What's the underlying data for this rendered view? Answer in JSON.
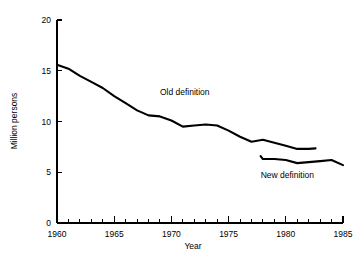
{
  "chart_data": {
    "type": "line",
    "title": "",
    "xlabel": "Year",
    "ylabel": "Million persons",
    "xlim": [
      1960,
      1985
    ],
    "ylim": [
      0,
      20
    ],
    "grid": false,
    "legend_position": "inline-annotations",
    "x_ticks": [
      1960,
      1965,
      1970,
      1975,
      1980,
      1985
    ],
    "x_tick_labels": [
      "1960",
      "1965",
      "1970",
      "1975",
      "1980",
      "1985"
    ],
    "x_minor_tick_step": 1,
    "y_ticks": [
      0,
      5,
      10,
      15,
      20
    ],
    "y_tick_labels": [
      "0",
      "5",
      "10",
      "15",
      "20"
    ],
    "series": [
      {
        "name": "Old definition",
        "annotation": "Old definition",
        "annotation_x": 1969.0,
        "annotation_y": 12.6,
        "x": [
          1960,
          1961,
          1962,
          1963,
          1964,
          1965,
          1966,
          1967,
          1968,
          1969,
          1970,
          1971,
          1972,
          1973,
          1974,
          1975,
          1976,
          1977,
          1978,
          1979,
          1980,
          1981,
          1982,
          1982.6
        ],
        "values": [
          15.6,
          15.2,
          14.5,
          13.9,
          13.3,
          12.5,
          11.8,
          11.1,
          10.6,
          10.5,
          10.1,
          9.5,
          9.6,
          9.7,
          9.6,
          9.1,
          8.5,
          8.0,
          8.2,
          7.9,
          7.6,
          7.3,
          7.3,
          7.35
        ]
      },
      {
        "name": "New definition",
        "annotation": "New definition",
        "annotation_x": 1977.8,
        "annotation_y": 4.4,
        "x": [
          1977.8,
          1978,
          1979,
          1980,
          1981,
          1982,
          1983,
          1984,
          1985
        ],
        "values": [
          6.6,
          6.3,
          6.3,
          6.2,
          5.9,
          6.0,
          6.1,
          6.2,
          5.7
        ]
      }
    ]
  },
  "axes": {
    "y_axis_title": "Million persons",
    "x_axis_title": "Year"
  },
  "colors": {
    "line": "#000000",
    "axis": "#000000",
    "background": "#ffffff",
    "text": "#000000"
  }
}
